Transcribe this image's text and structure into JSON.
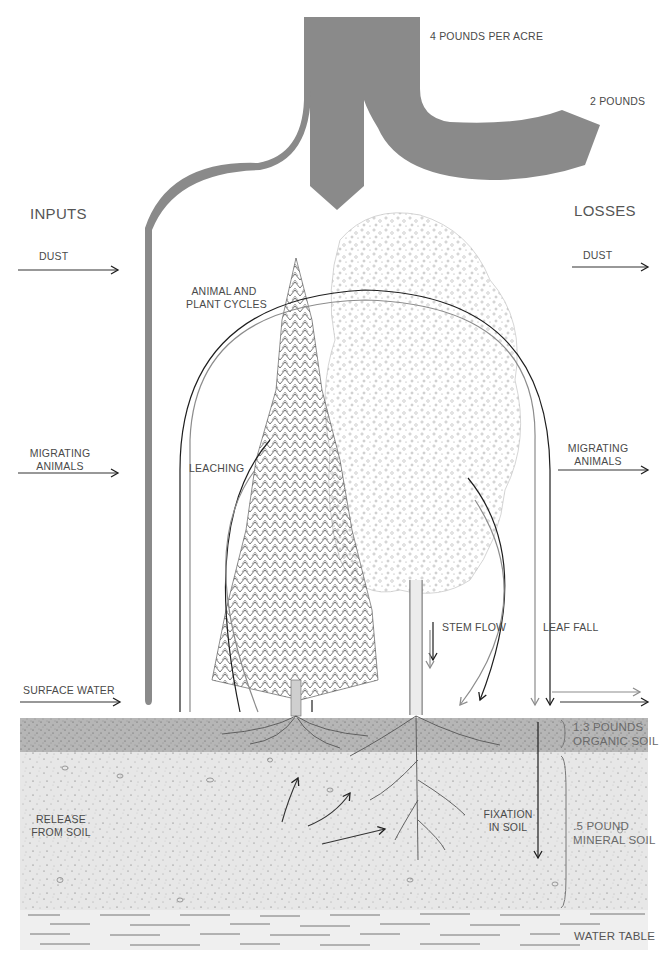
{
  "figure": {
    "title_cropped": "",
    "flow_labels": {
      "top_flow": "4 POUNDS PER ACRE",
      "right_flow": "2 POUNDS"
    },
    "column_headers": {
      "inputs": "INPUTS",
      "losses": "LOSSES"
    },
    "inputs": [
      {
        "id": "dust",
        "label_line1": "DUST",
        "label_line2": ""
      },
      {
        "id": "migrating-animals",
        "label_line1": "MIGRATING",
        "label_line2": "ANIMALS"
      },
      {
        "id": "surface-water",
        "label_line1": "SURFACE WATER",
        "label_line2": ""
      },
      {
        "id": "release-from-soil",
        "label_line1": "RELEASE",
        "label_line2": "FROM SOIL"
      }
    ],
    "losses": [
      {
        "id": "dust",
        "label_line1": "DUST",
        "label_line2": ""
      },
      {
        "id": "migrating-animals",
        "label_line1": "MIGRATING",
        "label_line2": "ANIMALS"
      }
    ],
    "cycles": {
      "animal_plant_line1": "ANIMAL AND",
      "animal_plant_line2": "PLANT CYCLES",
      "leaching": "LEACHING",
      "stem_flow": "STEM FLOW",
      "leaf_fall": "LEAF FALL",
      "fixation_line1": "FIXATION",
      "fixation_line2": "IN SOIL"
    },
    "soil_layers": {
      "organic_line1": "1.3 POUNDS",
      "organic_line2": "ORGANIC SOIL",
      "mineral_line1": ".5 POUND",
      "mineral_line2": "MINERAL SOIL",
      "water_table": "WATER TABLE"
    },
    "colors": {
      "flow_gray": "#8a8a8a",
      "organic_soil": "#b9b9b9",
      "mineral_soil": "#e6e6e6",
      "water_table": "#eeeeee",
      "arrow_dark": "#1e1e1e",
      "arrow_gray": "#8c8c8c"
    }
  }
}
